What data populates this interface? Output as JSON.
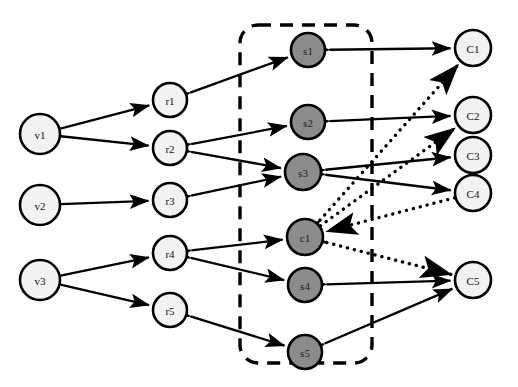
{
  "figure": {
    "type": "directed-graph-diagram",
    "background": "#ffffff",
    "width": 518,
    "height": 387
  },
  "styles": {
    "node_white_fill": "#f2f2f2",
    "node_gray_fill": "#8c8c8c",
    "node_stroke": "#000000",
    "edge_color": "#000000",
    "dashed_box_color": "#000000"
  },
  "groups": [
    {
      "name": "dashed-boundary-box",
      "shape": "rounded-rectangle",
      "style": "dashed",
      "x": 240,
      "y": 25,
      "width": 132,
      "height": 338,
      "radius": 18
    }
  ],
  "nodes": [
    {
      "id": "v1",
      "label": "v1",
      "x": 40,
      "y": 134,
      "r": 20,
      "fill": "white",
      "column": "left"
    },
    {
      "id": "v2",
      "label": "v2",
      "x": 40,
      "y": 205,
      "r": 20,
      "fill": "white",
      "column": "left"
    },
    {
      "id": "v3",
      "label": "v3",
      "x": 40,
      "y": 280,
      "r": 20,
      "fill": "white",
      "column": "left"
    },
    {
      "id": "r1",
      "label": "r1",
      "x": 170,
      "y": 100,
      "r": 17,
      "fill": "white",
      "column": "middle-left"
    },
    {
      "id": "r2",
      "label": "r2",
      "x": 170,
      "y": 148,
      "r": 17,
      "fill": "white",
      "column": "middle-left"
    },
    {
      "id": "r3",
      "label": "r3",
      "x": 170,
      "y": 200,
      "r": 17,
      "fill": "white",
      "column": "middle-left"
    },
    {
      "id": "r4",
      "label": "r4",
      "x": 170,
      "y": 253,
      "r": 17,
      "fill": "white",
      "column": "middle-left"
    },
    {
      "id": "r5",
      "label": "r5",
      "x": 170,
      "y": 310,
      "r": 17,
      "fill": "white",
      "column": "middle-left"
    },
    {
      "id": "s1",
      "label": "s1",
      "x": 308,
      "y": 50,
      "r": 17,
      "fill": "gray",
      "column": "center"
    },
    {
      "id": "s2",
      "label": "s2",
      "x": 308,
      "y": 122,
      "r": 17,
      "fill": "gray",
      "column": "center"
    },
    {
      "id": "s3",
      "label": "s3",
      "x": 303,
      "y": 172,
      "r": 18,
      "fill": "gray",
      "column": "center"
    },
    {
      "id": "c1",
      "label": "c1",
      "x": 305,
      "y": 237,
      "r": 18,
      "fill": "gray",
      "column": "center"
    },
    {
      "id": "s4",
      "label": "s4",
      "x": 305,
      "y": 285,
      "r": 17,
      "fill": "gray",
      "column": "center"
    },
    {
      "id": "s5",
      "label": "s5",
      "x": 305,
      "y": 352,
      "r": 17,
      "fill": "gray",
      "column": "center"
    },
    {
      "id": "C1",
      "label": "C1",
      "x": 473,
      "y": 48,
      "r": 18,
      "fill": "white",
      "column": "right"
    },
    {
      "id": "C2",
      "label": "C2",
      "x": 473,
      "y": 115,
      "r": 18,
      "fill": "white",
      "column": "right"
    },
    {
      "id": "C3",
      "label": "C3",
      "x": 473,
      "y": 155,
      "r": 18,
      "fill": "white",
      "column": "right"
    },
    {
      "id": "C4",
      "label": "C4",
      "x": 473,
      "y": 193,
      "r": 18,
      "fill": "white",
      "column": "right"
    },
    {
      "id": "C5",
      "label": "C5",
      "x": 473,
      "y": 280,
      "r": 18,
      "fill": "white",
      "column": "right"
    }
  ],
  "edges": [
    {
      "from": "v1",
      "to": "r1",
      "style": "solid",
      "arrow": "end"
    },
    {
      "from": "v1",
      "to": "r2",
      "style": "solid",
      "arrow": "end"
    },
    {
      "from": "v2",
      "to": "r3",
      "style": "solid",
      "arrow": "end"
    },
    {
      "from": "v3",
      "to": "r4",
      "style": "solid",
      "arrow": "end"
    },
    {
      "from": "v3",
      "to": "r5",
      "style": "solid",
      "arrow": "end"
    },
    {
      "from": "r1",
      "to": "s1",
      "style": "solid",
      "arrow": "both"
    },
    {
      "from": "r2",
      "to": "s2",
      "style": "solid",
      "arrow": "both"
    },
    {
      "from": "r2",
      "to": "s3",
      "style": "solid",
      "arrow": "both"
    },
    {
      "from": "r3",
      "to": "s3",
      "style": "solid",
      "arrow": "both"
    },
    {
      "from": "r4",
      "to": "c1",
      "style": "solid",
      "arrow": "both"
    },
    {
      "from": "r4",
      "to": "s4",
      "style": "solid",
      "arrow": "both"
    },
    {
      "from": "r5",
      "to": "s5",
      "style": "solid",
      "arrow": "both"
    },
    {
      "from": "s1",
      "to": "C1",
      "style": "solid",
      "arrow": "both"
    },
    {
      "from": "s2",
      "to": "C2",
      "style": "solid",
      "arrow": "both"
    },
    {
      "from": "s3",
      "to": "C3",
      "style": "solid",
      "arrow": "both"
    },
    {
      "from": "s3",
      "to": "C4",
      "style": "solid",
      "arrow": "both"
    },
    {
      "from": "s4",
      "to": "C5",
      "style": "solid",
      "arrow": "both"
    },
    {
      "from": "s5",
      "to": "C5",
      "style": "solid",
      "arrow": "both"
    },
    {
      "from": "c1",
      "to": "C1",
      "style": "dotted",
      "arrow": "both"
    },
    {
      "from": "c1",
      "to": "C2",
      "style": "dotted",
      "arrow": "end"
    },
    {
      "from": "C4",
      "to": "c1",
      "style": "dotted",
      "arrow": "end"
    },
    {
      "from": "c1",
      "to": "C5",
      "style": "dotted",
      "arrow": "both"
    }
  ]
}
